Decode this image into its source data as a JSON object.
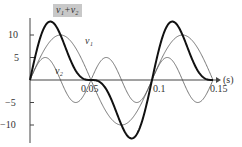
{
  "chart_data": {
    "type": "line",
    "title": "",
    "xlabel": "(s)",
    "ylabel": "",
    "xlim": [
      0,
      0.15
    ],
    "ylim": [
      -13,
      14
    ],
    "x_ticks": [
      0.05,
      0.1,
      0.15
    ],
    "x_tick_labels": [
      "0.05",
      "0.1",
      "0.15"
    ],
    "y_ticks": [
      10,
      5,
      -5,
      -10
    ],
    "y_tick_labels": [
      "10",
      "5",
      "−5",
      "−10"
    ],
    "grid": false,
    "legend": "inline labels",
    "series": [
      {
        "name": "v1",
        "label": "v₁",
        "formula": "10*sin(2*pi*10*t)",
        "amplitude": 10,
        "period": 0.1,
        "style": "thin",
        "color": "#555555"
      },
      {
        "name": "v2",
        "label": "v₂",
        "formula": "5*sin(2*pi*20*t)",
        "amplitude": 5,
        "period": 0.05,
        "style": "thin",
        "color": "#555555"
      },
      {
        "name": "v1+v2",
        "label": "v₁+v₂",
        "formula": "v1+v2",
        "peak": 12.3,
        "trough": -12.3,
        "style": "bold",
        "color": "#111111"
      }
    ]
  },
  "labels": {
    "sum": "v₁+v₂",
    "v1": "v₁",
    "v2": "v₂",
    "x_unit": "(s)",
    "y10": "10",
    "y5": "5",
    "ym5": "−5",
    "ym10": "−10",
    "x005": "0.05",
    "x01": "0.1",
    "x015": "0.15"
  }
}
